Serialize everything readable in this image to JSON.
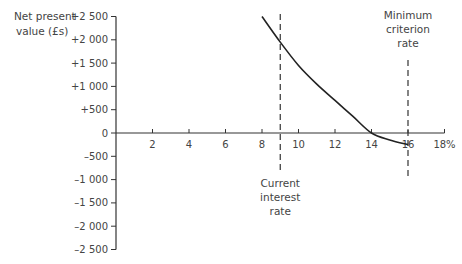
{
  "chart_data": {
    "type": "line",
    "title": "",
    "ylabel": "Net present value (£s)",
    "xlabel": "",
    "xlim": [
      0,
      18
    ],
    "ylim": [
      -2500,
      2500
    ],
    "x_ticks": [
      2,
      4,
      6,
      8,
      10,
      12,
      14,
      16,
      18
    ],
    "x_tick_labels": [
      "2",
      "4",
      "6",
      "8",
      "10",
      "12",
      "14",
      "16",
      "18%"
    ],
    "y_ticks": [
      2500,
      2000,
      1500,
      1000,
      500,
      0,
      -500,
      -1000,
      -1500,
      -2000,
      -2500
    ],
    "y_tick_labels": [
      "+2 500",
      "+2 000",
      "+1 500",
      "+1 000",
      "+500",
      "0",
      "–500",
      "–1 000",
      "–1 500",
      "–2 000",
      "–2 500"
    ],
    "grid": false,
    "series": [
      {
        "name": "NPV curve",
        "x": [
          8,
          9,
          10,
          11,
          12,
          13,
          14,
          15,
          16
        ],
        "y": [
          2500,
          1950,
          1450,
          1050,
          700,
          350,
          0,
          -150,
          -250
        ]
      }
    ],
    "reference_lines": [
      {
        "x": 9,
        "label": [
          "Current",
          "interest",
          "rate"
        ],
        "label_position": "bottom"
      },
      {
        "x": 16,
        "label": [
          "Minimum",
          "criterion",
          "rate"
        ],
        "label_position": "top"
      }
    ]
  }
}
